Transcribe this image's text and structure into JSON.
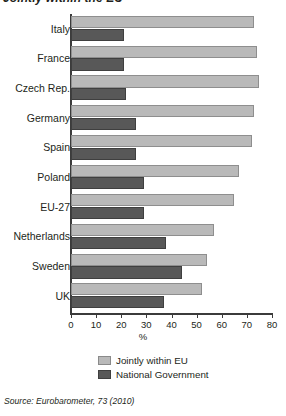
{
  "title": "Jointly within the EU",
  "source": "Source: Eurobarometer, 73 (2010)",
  "legend": {
    "series1_label": "Jointly within EU",
    "series2_label": "National Government"
  },
  "colors": {
    "jointly_within_eu": "#b9b9b9",
    "national_government": "#585858",
    "axis": "#3b3b3b",
    "text": "#231f20"
  },
  "chart_data": {
    "type": "bar",
    "orientation": "horizontal",
    "title": "Jointly within the EU",
    "xlabel": "%",
    "ylabel": "",
    "xlim": [
      0,
      80
    ],
    "xticks": [
      0,
      10,
      20,
      30,
      40,
      50,
      60,
      70,
      80
    ],
    "grid": false,
    "legend_position": "bottom",
    "categories": [
      "Italy",
      "France",
      "Czech Rep.",
      "Germany",
      "Spain",
      "Poland",
      "EU-27",
      "Netherlands",
      "Sweden",
      "UK"
    ],
    "series": [
      {
        "name": "Jointly within EU",
        "color": "#b9b9b9",
        "values": [
          73,
          74,
          75,
          73,
          72,
          67,
          65,
          57,
          54,
          52
        ]
      },
      {
        "name": "National Government",
        "color": "#585858",
        "values": [
          21,
          21,
          22,
          26,
          26,
          29,
          29,
          38,
          44,
          37
        ]
      }
    ]
  }
}
